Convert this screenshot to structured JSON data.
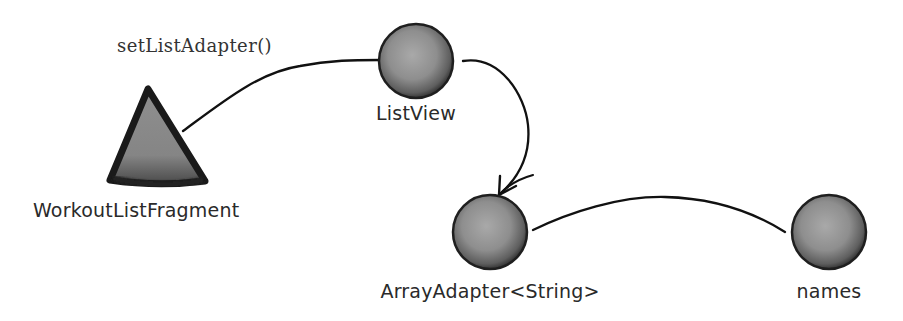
{
  "diagram": {
    "type": "object-graph",
    "colors": {
      "background": "#ffffff",
      "node_fill": "#8c8c8c",
      "node_highlight": "#a8a8a8",
      "node_outline": "#1e1e1e",
      "connector": "#111111",
      "text": "#2a2a2a"
    },
    "method_call": {
      "label": "setListAdapter()"
    },
    "nodes": [
      {
        "id": "workout-list-fragment",
        "shape": "triangle",
        "label": "WorkoutListFragment"
      },
      {
        "id": "list-view",
        "shape": "circle",
        "label": "ListView"
      },
      {
        "id": "array-adapter",
        "shape": "circle",
        "label": "ArrayAdapter<String>"
      },
      {
        "id": "names",
        "shape": "circle",
        "label": "names"
      }
    ],
    "edges": [
      {
        "from": "workout-list-fragment",
        "to": "list-view",
        "style": "line",
        "label": "setListAdapter()"
      },
      {
        "from": "list-view",
        "to": "array-adapter",
        "style": "arrow"
      },
      {
        "from": "array-adapter",
        "to": "names",
        "style": "line"
      }
    ]
  }
}
